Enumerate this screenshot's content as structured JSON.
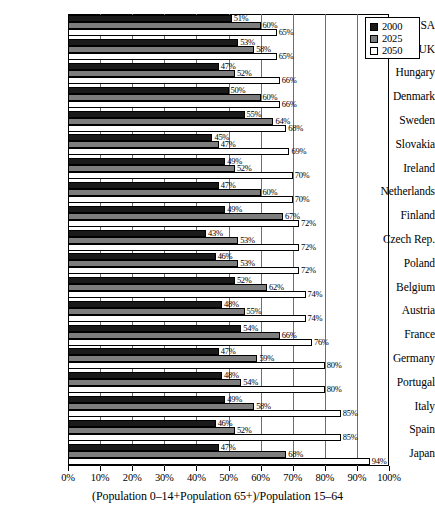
{
  "chart_data": {
    "type": "bar",
    "orientation": "horizontal",
    "title": "",
    "xlabel": "(Population 0–14+Population 65+)/Population 15–64",
    "ylabel": "",
    "xlim": [
      0,
      100
    ],
    "xtick_labels": [
      "0%",
      "10%",
      "20%",
      "30%",
      "40%",
      "50%",
      "60%",
      "70%",
      "80%",
      "90%",
      "100%"
    ],
    "xticks": [
      0,
      10,
      20,
      30,
      40,
      50,
      60,
      70,
      80,
      90,
      100
    ],
    "grid": true,
    "legend_position": "top-right",
    "categories": [
      "USA",
      "UK",
      "Hungary",
      "Denmark",
      "Sweden",
      "Slovakia",
      "Ireland",
      "Netherlands",
      "Finland",
      "Czech Rep.",
      "Poland",
      "Belgium",
      "Austria",
      "France",
      "Germany",
      "Portugal",
      "Italy",
      "Spain",
      "Japan"
    ],
    "series": [
      {
        "name": "2000",
        "color": "#1a1a1a",
        "values": [
          51,
          53,
          47,
          50,
          55,
          45,
          49,
          47,
          49,
          43,
          46,
          52,
          48,
          54,
          47,
          48,
          49,
          46,
          47
        ],
        "value_labels": [
          "51%",
          "53%",
          "47%",
          "50%",
          "55%",
          "45%",
          "49%",
          "47%",
          "49%",
          "43%",
          "46%",
          "52%",
          "48%",
          "54%",
          "47%",
          "48%",
          "49%",
          "46%",
          "47%"
        ]
      },
      {
        "name": "2025",
        "color": "#7d7d7d",
        "values": [
          60,
          58,
          52,
          60,
          64,
          47,
          52,
          60,
          67,
          53,
          53,
          62,
          55,
          66,
          59,
          54,
          58,
          52,
          68
        ],
        "value_labels": [
          "60%",
          "58%",
          "52%",
          "60%",
          "64%",
          "47%",
          "52%",
          "60%",
          "67%",
          "53%",
          "53%",
          "62%",
          "55%",
          "66%",
          "59%",
          "54%",
          "58%",
          "52%",
          "68%"
        ]
      },
      {
        "name": "2050",
        "color": "#ffffff",
        "values": [
          65,
          65,
          66,
          66,
          68,
          69,
          70,
          70,
          72,
          72,
          72,
          74,
          74,
          76,
          80,
          80,
          85,
          85,
          94
        ],
        "value_labels": [
          "65%",
          "65%",
          "66%",
          "66%",
          "68%",
          "69%",
          "70%",
          "70%",
          "72%",
          "72%",
          "72%",
          "74%",
          "74%",
          "76%",
          "80%",
          "80%",
          "85%",
          "85%",
          "94%"
        ]
      }
    ]
  },
  "legend": {
    "entries": [
      {
        "label": "2000",
        "color": "#1a1a1a"
      },
      {
        "label": "2025",
        "color": "#7d7d7d"
      },
      {
        "label": "2050",
        "color": "#ffffff"
      }
    ]
  }
}
